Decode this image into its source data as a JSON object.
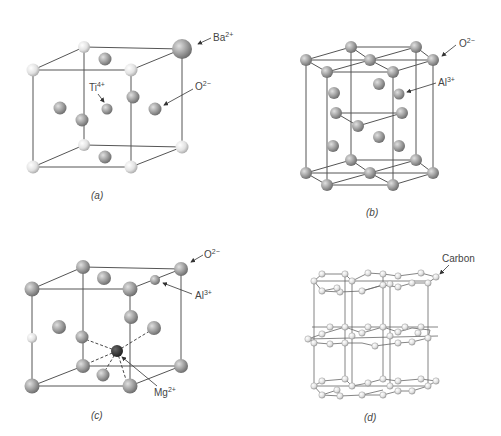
{
  "figure": {
    "panels": [
      {
        "id": "a",
        "caption": "(a)",
        "labels": {
          "ba": "Ba",
          "ba_charge": "2+",
          "ti": "Ti",
          "ti_charge": "4+",
          "o": "O",
          "o_charge": "2−"
        }
      },
      {
        "id": "b",
        "caption": "(b)",
        "labels": {
          "o": "O",
          "o_charge": "2−",
          "al": "Al",
          "al_charge": "3+"
        }
      },
      {
        "id": "c",
        "caption": "(c)",
        "labels": {
          "o": "O",
          "o_charge": "2−",
          "al": "Al",
          "al_charge": "3+",
          "mg": "Mg",
          "mg_charge": "2+"
        }
      },
      {
        "id": "d",
        "caption": "(d)",
        "labels": {
          "carbon": "Carbon"
        }
      }
    ]
  },
  "colors": {
    "line": "#555555",
    "sphere_light": "#e8e8e8",
    "sphere_mid": "#9a9a9a",
    "sphere_dark": "#333333",
    "text": "#444444"
  }
}
